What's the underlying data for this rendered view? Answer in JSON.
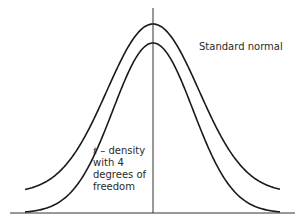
{
  "figure": {
    "labels": {
      "normal": "Standard normal",
      "t_symbol": "t",
      "t_line1_rest": " – density",
      "t_line2": "with 4",
      "t_line3": "degrees of",
      "t_line4": "freedom"
    },
    "colors": {
      "curve": "#1a1a1a",
      "axis": "#333333",
      "text": "#2a2a2a"
    }
  },
  "chart_data": {
    "type": "line",
    "title": "",
    "xlabel": "",
    "ylabel": "",
    "xlim": [
      -4,
      4
    ],
    "grid": false,
    "series": [
      {
        "name": "Standard normal",
        "distribution": "normal",
        "mean": 0,
        "sd": 1
      },
      {
        "name": "t-density with 4 degrees of freedom",
        "distribution": "t",
        "df": 4
      }
    ]
  }
}
